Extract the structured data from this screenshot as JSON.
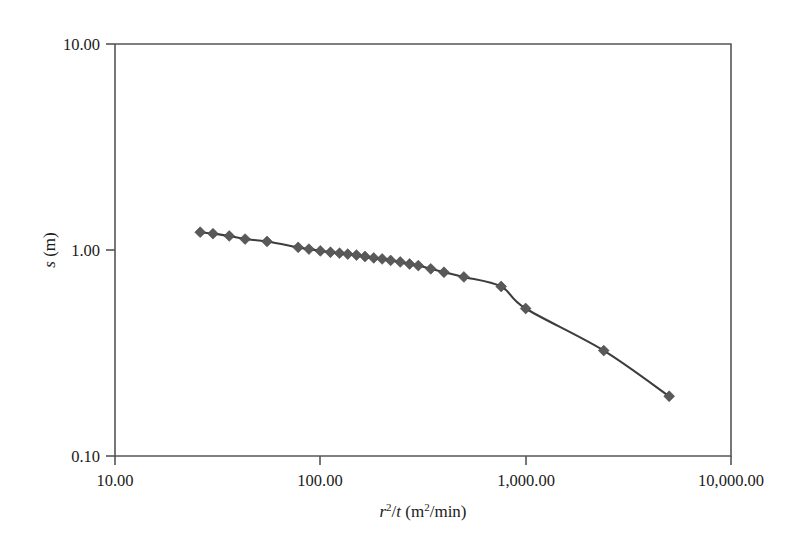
{
  "chart_data": {
    "type": "line",
    "title": "",
    "subtitle": "",
    "xlabel": "r^2/t (m^2/min)",
    "ylabel": "s (m)",
    "xscale": "log",
    "yscale": "log",
    "xlim": [
      10.0,
      10000.0
    ],
    "ylim": [
      0.1,
      10.0
    ],
    "grid": false,
    "legend": null,
    "marker": "diamond",
    "marker_color": "#595959",
    "line_color": "#3d3d3d",
    "x_tick_labels": [
      "10.00",
      "100.00",
      "1,000.00",
      "10,000.00"
    ],
    "x_tick_values": [
      10.0,
      100.0,
      1000.0,
      10000.0
    ],
    "y_tick_labels": [
      "10.00",
      "1.00",
      "0.10"
    ],
    "y_tick_values": [
      10.0,
      1.0,
      0.1
    ],
    "series": [
      {
        "name": "drawdown",
        "x": [
          26,
          30,
          36,
          43,
          55,
          78,
          88,
          100,
          112,
          124,
          136,
          150,
          165,
          182,
          200,
          220,
          245,
          272,
          300,
          345,
          400,
          500,
          760,
          1000,
          2400,
          5000
        ],
        "y": [
          1.22,
          1.2,
          1.17,
          1.13,
          1.1,
          1.03,
          1.01,
          0.99,
          0.975,
          0.965,
          0.955,
          0.945,
          0.93,
          0.915,
          0.905,
          0.89,
          0.875,
          0.855,
          0.84,
          0.81,
          0.78,
          0.74,
          0.665,
          0.52,
          0.325,
          0.195
        ]
      }
    ]
  },
  "axis_titles": {
    "x_prefix_italic": "r",
    "x_sup": "2",
    "x_mid": "/",
    "x_italic_t": "t",
    "x_unit_open": " (m",
    "x_unit_sup": "2",
    "x_unit_close": "/min)",
    "y_italic": "s",
    "y_unit": " (m)"
  }
}
